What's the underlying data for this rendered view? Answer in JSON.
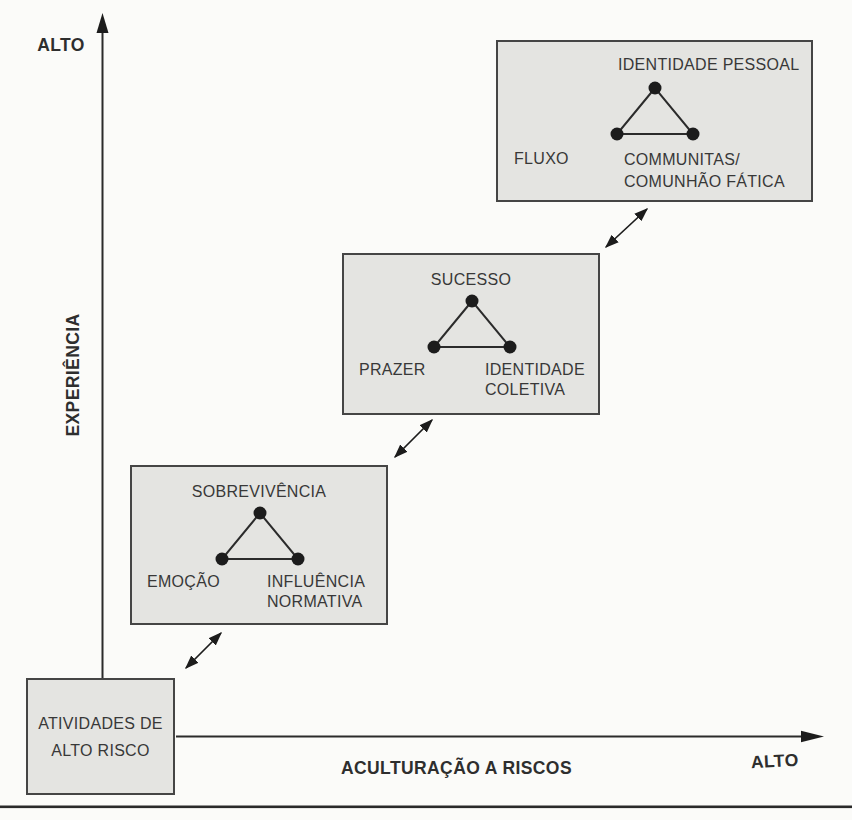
{
  "figure": {
    "y_axis": {
      "name": "EXPERIÊNCIA",
      "high_label": "ALTO"
    },
    "x_axis": {
      "name": "ACULTURAÇÃO A RISCOS",
      "high_label": "ALTO"
    },
    "stages": [
      {
        "title_line1": "ATIVIDADES DE",
        "title_line2": "ALTO RISCO"
      },
      {
        "top_vertex": "SOBREVIVÊNCIA",
        "left_vertex": "EMOÇÃO",
        "right_vertex_line1": "INFLUÊNCIA",
        "right_vertex_line2": "NORMATIVA"
      },
      {
        "top_vertex": "SUCESSO",
        "left_vertex": "PRAZER",
        "right_vertex_line1": "IDENTIDADE",
        "right_vertex_line2": "COLETIVA"
      },
      {
        "top_vertex": "IDENTIDADE PESSOAL",
        "left_vertex": "FLUXO",
        "right_vertex_line1": "COMMUNITAS/",
        "right_vertex_line2": "COMUNHÃO FÁTICA"
      }
    ],
    "colors": {
      "background": "#fbfbf9",
      "box_fill": "#e4e4e1",
      "box_border": "#454545",
      "ink": "#383838",
      "line": "#1c1c1c"
    }
  }
}
